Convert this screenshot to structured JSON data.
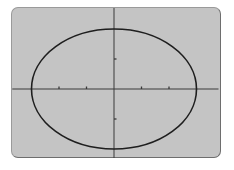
{
  "chart_data": {
    "type": "line",
    "title": "",
    "xlabel": "",
    "ylabel": "",
    "equation": "x^2/9 + y^2/4 = 1",
    "series": [
      {
        "name": "ellipse",
        "center": [
          0,
          0
        ],
        "semi_axis_x": 3,
        "semi_axis_y": 2,
        "points": [
          [
            -3,
            0
          ],
          [
            0,
            2
          ],
          [
            3,
            0
          ],
          [
            0,
            -2
          ]
        ]
      }
    ],
    "xlim": [
      -3.7,
      3.8
    ],
    "ylim": [
      -2.3,
      2.7
    ],
    "x_ticks": [
      -2,
      -1,
      1,
      2
    ],
    "y_ticks": [
      -1,
      1
    ],
    "tick_labels": "none",
    "grid": false,
    "legend": "none"
  },
  "colors": {
    "screen_background": "#c4c4c4",
    "curve": "#1e1e1e",
    "axes": "#3a3a3a",
    "bezel": "#6e6e6e"
  },
  "pixel_map": {
    "origin_px": [
      114,
      89
    ],
    "x_unit_px": 27.5,
    "y_unit_px": 30
  }
}
